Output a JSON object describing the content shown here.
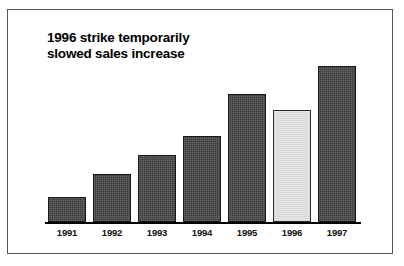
{
  "chart_data": {
    "type": "bar",
    "title": "1996 strike temporarily\nslowed sales increase",
    "xlabel": "",
    "ylabel": "",
    "categories": [
      "1991",
      "1992",
      "1993",
      "1994",
      "1995",
      "1996",
      "1997"
    ],
    "values": [
      16,
      31,
      43,
      55,
      82,
      72,
      100
    ],
    "ylim": [
      0,
      100
    ],
    "grid": false,
    "legend": "none",
    "axis": {
      "y_axis_visible": false,
      "x_axis_visible": true,
      "tick_labels_shown": true,
      "value_labels_shown": false
    },
    "series": [
      {
        "name": "Sales",
        "values": [
          16,
          31,
          43,
          55,
          82,
          72,
          100
        ]
      }
    ],
    "bar_styles": [
      "dark",
      "dark",
      "dark",
      "dark",
      "dark",
      "light",
      "dark"
    ],
    "highlighted_category": "1996",
    "annotations": []
  },
  "colors": {
    "bar_dark": "#3c3c3c",
    "bar_dark_border": "#1a1a1a",
    "bar_light": "#e4e4e4",
    "bar_light_border": "#2b2b2b",
    "axis": "#000000",
    "frame": "#555555",
    "background": "#ffffff",
    "text": "#000000"
  },
  "figure": {
    "title_text": "1996 strike temporarily\nslowed sales increase"
  }
}
